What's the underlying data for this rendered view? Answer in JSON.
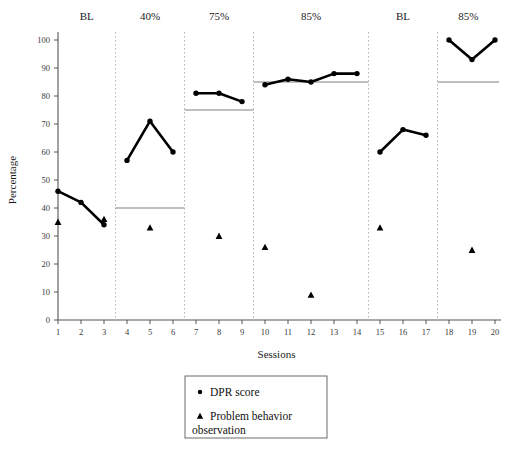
{
  "chart_data": {
    "type": "line",
    "title": "",
    "xlabel": "Sessions",
    "ylabel": "Percentage",
    "xlim": [
      1,
      20
    ],
    "ylim": [
      0,
      100
    ],
    "ytick_step": 10,
    "yticks": [
      0,
      10,
      20,
      30,
      40,
      50,
      60,
      70,
      80,
      90,
      100
    ],
    "xticks": [
      1,
      2,
      3,
      4,
      5,
      6,
      7,
      8,
      9,
      10,
      11,
      12,
      13,
      14,
      15,
      16,
      17,
      18,
      19,
      20
    ],
    "grid": false,
    "legend_position": "below-plot",
    "phases": [
      {
        "label": "BL",
        "start": 1,
        "end": 3,
        "criterion": null
      },
      {
        "label": "40%",
        "start": 4,
        "end": 6,
        "criterion": 40
      },
      {
        "label": "75%",
        "start": 7,
        "end": 9,
        "criterion": 75
      },
      {
        "label": "85%",
        "start": 10,
        "end": 14,
        "criterion": 85
      },
      {
        "label": "BL",
        "start": 15,
        "end": 17,
        "criterion": null
      },
      {
        "label": "85%",
        "start": 18,
        "end": 20,
        "criterion": 85
      }
    ],
    "series": [
      {
        "name": "DPR score",
        "marker": "circle",
        "connected_within_phase": true,
        "x": [
          1,
          2,
          3,
          4,
          5,
          6,
          7,
          8,
          9,
          10,
          11,
          12,
          13,
          14,
          15,
          16,
          17,
          18,
          19,
          20
        ],
        "values": [
          46,
          42,
          34,
          57,
          71,
          60,
          81,
          81,
          78,
          84,
          86,
          85,
          88,
          88,
          60,
          68,
          66,
          100,
          93,
          100
        ]
      },
      {
        "name": "Problem behavior observation",
        "marker": "triangle",
        "connected_within_phase": false,
        "x": [
          1,
          3,
          5,
          8,
          10,
          12,
          15,
          19
        ],
        "values": [
          35,
          36,
          33,
          30,
          26,
          9,
          33,
          25
        ]
      }
    ],
    "legend": [
      {
        "marker": "circle",
        "label": "DPR score"
      },
      {
        "marker": "triangle",
        "label": "Problem behavior observation"
      }
    ],
    "colors": {
      "series_dpr": "#000000",
      "series_problem": "#000000",
      "axis": "#555555",
      "criterion_line": "#808080",
      "phase_divider": "#b5b5b5"
    }
  }
}
